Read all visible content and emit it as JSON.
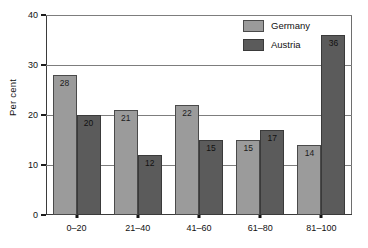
{
  "chart_data": {
    "type": "bar",
    "title": "",
    "xlabel": "",
    "ylabel": "Per cent",
    "categories": [
      "0–20",
      "21–40",
      "41–60",
      "61–80",
      "81–100"
    ],
    "series": [
      {
        "name": "Germany",
        "color": "#9b9b9b",
        "values": [
          28,
          21,
          22,
          15,
          14
        ]
      },
      {
        "name": "Austria",
        "color": "#5b5b5b",
        "values": [
          20,
          12,
          15,
          17,
          36
        ]
      }
    ],
    "ylim": [
      0,
      40
    ],
    "yticks": [
      0,
      10,
      20,
      30,
      40
    ],
    "ytick_labels": [
      "0",
      "10",
      "20",
      "30",
      "40"
    ],
    "grid": "horizontal",
    "legend_position": "top-right",
    "value_labels": "inside-top"
  },
  "legend": {
    "entries": [
      {
        "label": "Germany",
        "swatch": "series-germany"
      },
      {
        "label": "Austria",
        "swatch": "series-austria"
      }
    ]
  },
  "caption": {
    "text": ""
  }
}
